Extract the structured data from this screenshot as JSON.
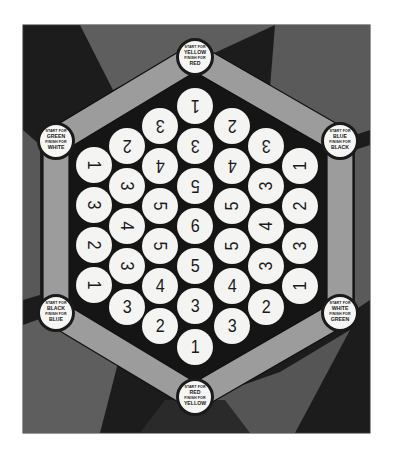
{
  "colors": {
    "background": "#ffffff",
    "board_dark": "#1c1c1c",
    "region_mid": "#5c5c5c",
    "region_light": "#6e6e6e",
    "track": "#9a9a9a",
    "hex_inner": "#141414",
    "cell_fill": "#f4f4f2",
    "cell_text": "#1a1a1a"
  },
  "nodes": [
    {
      "id": "top",
      "x": 195,
      "y": 57,
      "start_label": "START FOR",
      "start_color": "YELLOW",
      "finish_label": "FINISH FOR",
      "finish_color": "RED"
    },
    {
      "id": "top-left",
      "x": 56,
      "y": 141,
      "start_label": "START FOR",
      "start_color": "GREEN",
      "finish_label": "FINISH FOR",
      "finish_color": "WHITE"
    },
    {
      "id": "top-right",
      "x": 340,
      "y": 141,
      "start_label": "START FOR",
      "start_color": "BLUE",
      "finish_label": "FINISH FOR",
      "finish_color": "BLACK"
    },
    {
      "id": "bottom-left",
      "x": 56,
      "y": 313,
      "start_label": "START FOR",
      "start_color": "BLACK",
      "finish_label": "FINISH FOR",
      "finish_color": "BLUE"
    },
    {
      "id": "bottom-right",
      "x": 340,
      "y": 313,
      "start_label": "START FOR",
      "start_color": "WHITE",
      "finish_label": "FINISH FOR",
      "finish_color": "GREEN"
    },
    {
      "id": "bottom",
      "x": 195,
      "y": 397,
      "start_label": "START FOR",
      "start_color": "RED",
      "finish_label": "FINISH FOR",
      "finish_color": "YELLOW"
    }
  ],
  "cells": [
    {
      "x": 94,
      "y": 165,
      "value": "1",
      "rot": 90
    },
    {
      "x": 94,
      "y": 205,
      "value": "3",
      "rot": 90
    },
    {
      "x": 94,
      "y": 245,
      "value": "2",
      "rot": 90
    },
    {
      "x": 94,
      "y": 285,
      "value": "1",
      "rot": 90
    },
    {
      "x": 127,
      "y": 146,
      "value": "2",
      "rot": 180
    },
    {
      "x": 127,
      "y": 186,
      "value": "3",
      "rot": 90
    },
    {
      "x": 127,
      "y": 226,
      "value": "4",
      "rot": 90
    },
    {
      "x": 127,
      "y": 266,
      "value": "3",
      "rot": 90
    },
    {
      "x": 127,
      "y": 307,
      "value": "3",
      "rot": 0
    },
    {
      "x": 160,
      "y": 126,
      "value": "3",
      "rot": 180
    },
    {
      "x": 160,
      "y": 166,
      "value": "4",
      "rot": 180
    },
    {
      "x": 160,
      "y": 206,
      "value": "5",
      "rot": 90
    },
    {
      "x": 160,
      "y": 246,
      "value": "5",
      "rot": 90
    },
    {
      "x": 160,
      "y": 286,
      "value": "4",
      "rot": 0
    },
    {
      "x": 160,
      "y": 326,
      "value": "2",
      "rot": 0
    },
    {
      "x": 195,
      "y": 106,
      "value": "1",
      "rot": 180
    },
    {
      "x": 195,
      "y": 146,
      "value": "3",
      "rot": 180
    },
    {
      "x": 195,
      "y": 186,
      "value": "5",
      "rot": 180
    },
    {
      "x": 195,
      "y": 226,
      "value": "6",
      "rot": 0
    },
    {
      "x": 195,
      "y": 266,
      "value": "5",
      "rot": 0
    },
    {
      "x": 195,
      "y": 306,
      "value": "3",
      "rot": 0
    },
    {
      "x": 195,
      "y": 347,
      "value": "1",
      "rot": 0
    },
    {
      "x": 232,
      "y": 126,
      "value": "2",
      "rot": 180
    },
    {
      "x": 232,
      "y": 166,
      "value": "4",
      "rot": 180
    },
    {
      "x": 232,
      "y": 206,
      "value": "5",
      "rot": -90
    },
    {
      "x": 232,
      "y": 246,
      "value": "5",
      "rot": -90
    },
    {
      "x": 232,
      "y": 286,
      "value": "4",
      "rot": 0
    },
    {
      "x": 232,
      "y": 326,
      "value": "3",
      "rot": 0
    },
    {
      "x": 266,
      "y": 146,
      "value": "3",
      "rot": 180
    },
    {
      "x": 266,
      "y": 186,
      "value": "3",
      "rot": -90
    },
    {
      "x": 266,
      "y": 226,
      "value": "4",
      "rot": -90
    },
    {
      "x": 266,
      "y": 266,
      "value": "3",
      "rot": -90
    },
    {
      "x": 266,
      "y": 307,
      "value": "2",
      "rot": 0
    },
    {
      "x": 300,
      "y": 166,
      "value": "1",
      "rot": -90
    },
    {
      "x": 300,
      "y": 206,
      "value": "2",
      "rot": -90
    },
    {
      "x": 300,
      "y": 246,
      "value": "3",
      "rot": -90
    },
    {
      "x": 300,
      "y": 286,
      "value": "1",
      "rot": -90
    }
  ]
}
